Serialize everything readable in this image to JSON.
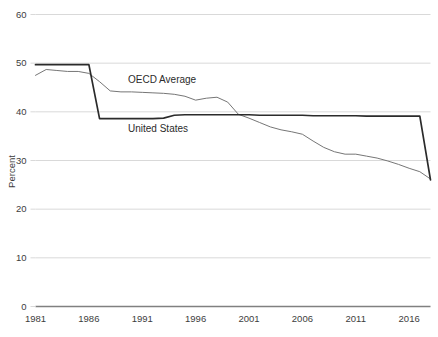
{
  "chart_data": {
    "type": "line",
    "title": "",
    "subtitle": "",
    "xlabel": "",
    "ylabel": "Percent",
    "xlim": [
      1981,
      2018
    ],
    "ylim": [
      0,
      60
    ],
    "ytick_values": [
      0,
      10,
      20,
      30,
      40,
      50,
      60
    ],
    "ytick_labels": [
      "0",
      "10",
      "20",
      "30",
      "40",
      "50",
      "60"
    ],
    "xtick_values": [
      1981,
      1986,
      1991,
      1996,
      2001,
      2006,
      2011,
      2016
    ],
    "xtick_labels": [
      "1981",
      "1986",
      "1991",
      "1996",
      "2001",
      "2006",
      "2011",
      "2016"
    ],
    "grid": "horizontal",
    "legend_position": "inline-annotations",
    "x": [
      1981,
      1982,
      1983,
      1984,
      1985,
      1986,
      1987,
      1988,
      1989,
      1990,
      1991,
      1992,
      1993,
      1994,
      1995,
      1996,
      1997,
      1998,
      1999,
      2000,
      2001,
      2002,
      2003,
      2004,
      2005,
      2006,
      2007,
      2008,
      2009,
      2010,
      2011,
      2012,
      2013,
      2014,
      2015,
      2016,
      2017,
      2018
    ],
    "series": [
      {
        "name": "United States",
        "color": "#2b2b2b",
        "width": 1.7,
        "values": [
          49.7,
          49.7,
          49.7,
          49.7,
          49.7,
          49.7,
          38.6,
          38.6,
          38.6,
          38.6,
          38.6,
          38.6,
          38.7,
          39.3,
          39.4,
          39.4,
          39.4,
          39.4,
          39.4,
          39.4,
          39.4,
          39.3,
          39.3,
          39.3,
          39.3,
          39.3,
          39.2,
          39.2,
          39.2,
          39.2,
          39.2,
          39.1,
          39.1,
          39.1,
          39.1,
          39.1,
          39.1,
          26.0
        ]
      },
      {
        "name": "OECD Average",
        "color": "#767676",
        "width": 1.0,
        "values": [
          47.5,
          48.7,
          48.5,
          48.3,
          48.3,
          47.9,
          46.2,
          44.3,
          44.1,
          44.1,
          44.0,
          43.9,
          43.8,
          43.6,
          43.2,
          42.4,
          42.8,
          43.0,
          42.0,
          39.5,
          38.7,
          37.8,
          36.9,
          36.3,
          35.9,
          35.4,
          34.0,
          32.7,
          31.8,
          31.3,
          31.3,
          30.9,
          30.5,
          29.9,
          29.2,
          28.4,
          27.7,
          26.2
        ]
      }
    ],
    "annotations": [
      {
        "text": "OECD Average",
        "name": "oecd-average-label"
      },
      {
        "text": "United States",
        "name": "united-states-label"
      }
    ]
  },
  "axes": {
    "y_title": "Percent",
    "colors": {
      "grid": "#d9d9d9",
      "axis": "#808080",
      "tick_text": "#3d3d3d",
      "united_states": "#2b2b2b",
      "oecd_average": "#767676"
    }
  }
}
